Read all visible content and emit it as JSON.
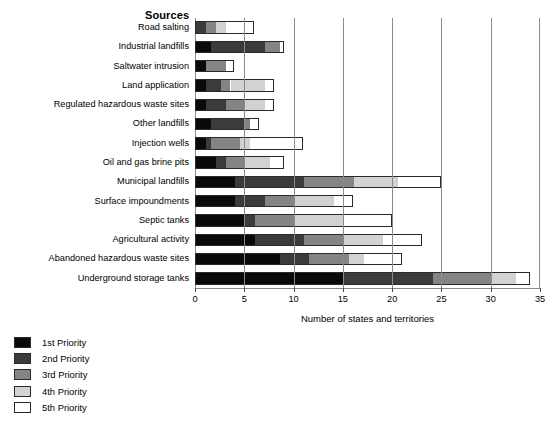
{
  "chart": {
    "title": "Sources",
    "xlabel": "Number of states and territories"
  },
  "legend": {
    "position": "below-left",
    "items": [
      {
        "label": "1st Priority",
        "color": "#0a0a0a"
      },
      {
        "label": "2nd Priority",
        "color": "#3b3b3b"
      },
      {
        "label": "3rd Priority",
        "color": "#848484"
      },
      {
        "label": "4th Priority",
        "color": "#d2d2d2"
      },
      {
        "label": "5th Priority",
        "color": "#ffffff"
      }
    ]
  },
  "axis": {
    "ticks": [
      0,
      5,
      10,
      15,
      20,
      25,
      30,
      35
    ],
    "tick_labels": [
      "0",
      "5",
      "10",
      "15",
      "20",
      "25",
      "30",
      "35"
    ],
    "xlim": [
      0,
      35
    ],
    "grid": true
  },
  "chart_data": {
    "type": "bar",
    "orientation": "horizontal",
    "stacked": true,
    "title": "Sources",
    "xlabel": "Number of states and territories",
    "ylabel": "Sources",
    "xlim": [
      0,
      35
    ],
    "grid": true,
    "legend_position": "below-left",
    "categories": [
      "Road salting",
      "Industrial landfills",
      "Saltwater intrusion",
      "Land application",
      "Regulated hazardous waste sites",
      "Other landfills",
      "Injection wells",
      "Oil and gas brine pits",
      "Municipal landfills",
      "Surface impoundments",
      "Septic tanks",
      "Agricultural activity",
      "Abandoned hazardous waste sites",
      "Underground storage tanks"
    ],
    "series": [
      {
        "name": "1st Priority",
        "color": "#0a0a0a",
        "values": [
          0,
          1.5,
          1,
          1,
          1,
          1.5,
          1,
          2,
          4,
          4,
          5,
          6,
          8.5,
          15
        ]
      },
      {
        "name": "2nd Priority",
        "color": "#3b3b3b",
        "values": [
          1,
          5.5,
          0,
          1.5,
          2,
          3.5,
          0.5,
          1,
          7,
          3,
          1,
          5,
          3,
          9
        ]
      },
      {
        "name": "3rd Priority",
        "color": "#848484",
        "values": [
          1,
          1.5,
          2,
          1,
          2,
          0.5,
          3,
          2,
          5,
          3,
          4,
          4,
          4,
          6
        ]
      },
      {
        "name": "4th Priority",
        "color": "#d2d2d2",
        "values": [
          1,
          0,
          0,
          3.5,
          2,
          0,
          1,
          2.5,
          4.5,
          4,
          5,
          4,
          1.5,
          2.5
        ]
      },
      {
        "name": "5th Priority",
        "color": "#ffffff",
        "values": [
          3,
          0.5,
          1,
          1,
          1,
          1,
          5.5,
          1.5,
          4.5,
          2,
          5,
          4,
          4,
          1.5
        ]
      }
    ],
    "totals": [
      6,
      9,
      4,
      8,
      8,
      6.5,
      11,
      9,
      25,
      16,
      20,
      23,
      21,
      34
    ]
  }
}
